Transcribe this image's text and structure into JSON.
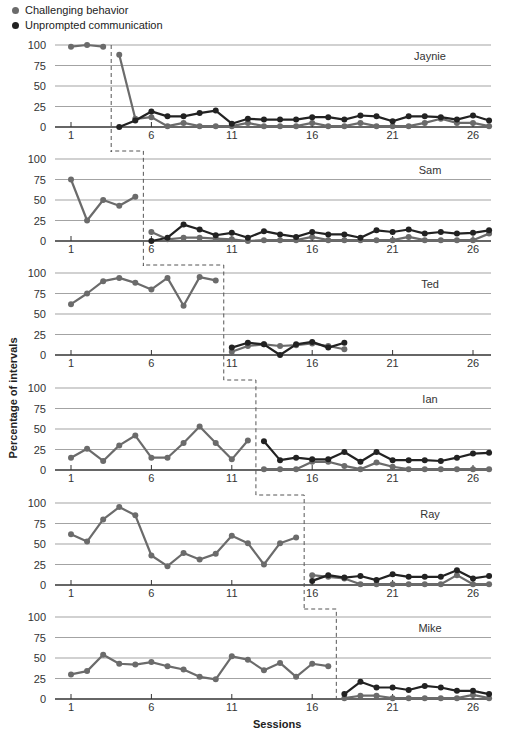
{
  "legend": {
    "items": [
      {
        "label": "Challenging behavior",
        "color": "#6b6b6b"
      },
      {
        "label": "Unprompted communication",
        "color": "#222222"
      }
    ]
  },
  "axis": {
    "ylabel": "Percentage of intervals",
    "xlabel": "Sessions",
    "yticks": [
      0,
      25,
      50,
      75,
      100
    ],
    "xticks": [
      1,
      6,
      11,
      16,
      21,
      26
    ]
  },
  "colors": {
    "challenging": "#6b6b6b",
    "communication": "#222222",
    "grid": "#999999"
  },
  "chart_data": {
    "type": "line",
    "title": "",
    "xlabel": "Sessions",
    "ylabel": "Percentage of intervals",
    "ylim": [
      0,
      100
    ],
    "xlim": [
      1,
      27
    ],
    "grid": true,
    "legend_position": "top-left",
    "design": "multiple baseline across participants",
    "panels": [
      {
        "name": "Jaynie",
        "phase_change_after_session": 3,
        "series": [
          {
            "name": "Challenging behavior",
            "x": [
              1,
              2,
              3,
              4,
              5,
              6,
              7,
              8,
              9,
              10,
              11,
              12,
              13,
              14,
              15,
              16,
              17,
              18,
              19,
              20,
              21,
              22,
              23,
              24,
              25,
              26,
              27
            ],
            "values": [
              98,
              100,
              98,
              88,
              10,
              12,
              1,
              5,
              1,
              1,
              1,
              5,
              1,
              1,
              1,
              5,
              1,
              1,
              5,
              1,
              1,
              1,
              5,
              10,
              5,
              5,
              1
            ]
          },
          {
            "name": "Unprompted communication",
            "x": [
              4,
              5,
              6,
              7,
              8,
              9,
              10,
              11,
              12,
              13,
              14,
              15,
              16,
              17,
              18,
              19,
              20,
              21,
              22,
              23,
              24,
              25,
              26,
              27
            ],
            "values": [
              0,
              8,
              19,
              13,
              13,
              17,
              20,
              4,
              10,
              9,
              9,
              9,
              12,
              12,
              9,
              14,
              13,
              7,
              13,
              13,
              12,
              9,
              14,
              8
            ]
          }
        ]
      },
      {
        "name": "Sam",
        "phase_change_after_session": 5,
        "series": [
          {
            "name": "Challenging behavior",
            "x": [
              1,
              2,
              3,
              4,
              5,
              6,
              7,
              8,
              9,
              10,
              11,
              12,
              13,
              14,
              15,
              16,
              17,
              18,
              19,
              20,
              21,
              22,
              23,
              24,
              25,
              26,
              27
            ],
            "values": [
              75,
              25,
              50,
              43,
              54,
              11,
              2,
              4,
              4,
              3,
              2,
              0,
              1,
              1,
              1,
              5,
              1,
              1,
              1,
              1,
              1,
              5,
              1,
              1,
              1,
              1,
              9
            ]
          },
          {
            "name": "Unprompted communication",
            "x": [
              6,
              7,
              8,
              9,
              10,
              11,
              12,
              13,
              14,
              15,
              16,
              17,
              18,
              19,
              20,
              21,
              22,
              23,
              24,
              25,
              26,
              27
            ],
            "values": [
              0,
              4,
              20,
              14,
              7,
              10,
              4,
              12,
              8,
              5,
              11,
              8,
              8,
              4,
              13,
              11,
              14,
              9,
              11,
              9,
              10,
              13
            ]
          }
        ]
      },
      {
        "name": "Ted",
        "phase_change_after_session": 10,
        "series": [
          {
            "name": "Challenging behavior",
            "x": [
              1,
              2,
              3,
              4,
              5,
              6,
              7,
              8,
              9,
              10,
              11,
              12,
              13,
              14,
              15,
              16,
              17,
              18
            ],
            "values": [
              62,
              75,
              90,
              94,
              88,
              80,
              94,
              60,
              95,
              91,
              4,
              11,
              13,
              11,
              12,
              14,
              11,
              7
            ]
          },
          {
            "name": "Unprompted communication",
            "x": [
              11,
              12,
              13,
              14,
              15,
              16,
              17,
              18
            ],
            "values": [
              9,
              15,
              13,
              0,
              13,
              16,
              9,
              15
            ]
          }
        ]
      },
      {
        "name": "Ian",
        "phase_change_after_session": 12,
        "series": [
          {
            "name": "Challenging behavior",
            "x": [
              1,
              2,
              3,
              4,
              5,
              6,
              7,
              8,
              9,
              10,
              11,
              12,
              13,
              14,
              15,
              16,
              17,
              18,
              19,
              20,
              21,
              22,
              23,
              24,
              25,
              26,
              27
            ],
            "values": [
              15,
              26,
              11,
              30,
              42,
              15,
              15,
              33,
              53,
              33,
              13,
              36,
              1,
              1,
              1,
              10,
              10,
              5,
              1,
              9,
              4,
              1,
              1,
              1,
              1,
              1,
              1
            ]
          },
          {
            "name": "Unprompted communication",
            "x": [
              13,
              14,
              15,
              16,
              17,
              18,
              19,
              20,
              21,
              22,
              23,
              24,
              25,
              26,
              27
            ],
            "values": [
              35,
              12,
              15,
              13,
              13,
              22,
              10,
              22,
              12,
              12,
              12,
              11,
              15,
              20,
              21
            ]
          }
        ]
      },
      {
        "name": "Ray",
        "phase_change_after_session": 15,
        "series": [
          {
            "name": "Challenging behavior",
            "x": [
              1,
              2,
              3,
              4,
              5,
              6,
              7,
              8,
              9,
              10,
              11,
              12,
              13,
              14,
              15,
              16,
              17,
              18,
              19,
              20,
              21,
              22,
              23,
              24,
              25,
              26,
              27
            ],
            "values": [
              62,
              53,
              80,
              95,
              85,
              36,
              23,
              39,
              31,
              38,
              60,
              51,
              25,
              51,
              58,
              12,
              10,
              8,
              1,
              1,
              1,
              1,
              1,
              1,
              12,
              1,
              1
            ]
          },
          {
            "name": "Unprompted communication",
            "x": [
              16,
              17,
              18,
              19,
              20,
              21,
              22,
              23,
              24,
              25,
              26,
              27
            ],
            "values": [
              5,
              12,
              9,
              11,
              6,
              13,
              10,
              10,
              10,
              18,
              8,
              11
            ]
          }
        ]
      },
      {
        "name": "Mike",
        "phase_change_after_session": 17,
        "series": [
          {
            "name": "Challenging behavior",
            "x": [
              1,
              2,
              3,
              4,
              5,
              6,
              7,
              8,
              9,
              10,
              11,
              12,
              13,
              14,
              15,
              16,
              17,
              18,
              19,
              20,
              21,
              22,
              23,
              24,
              25,
              26,
              27
            ],
            "values": [
              30,
              34,
              54,
              43,
              42,
              45,
              40,
              36,
              27,
              24,
              52,
              48,
              35,
              44,
              27,
              43,
              40,
              1,
              4,
              4,
              1,
              1,
              1,
              1,
              1,
              5,
              1
            ]
          },
          {
            "name": "Unprompted communication",
            "x": [
              18,
              19,
              20,
              21,
              22,
              23,
              24,
              25,
              26,
              27
            ],
            "values": [
              6,
              21,
              14,
              14,
              11,
              16,
              14,
              10,
              10,
              6
            ]
          }
        ]
      }
    ]
  }
}
